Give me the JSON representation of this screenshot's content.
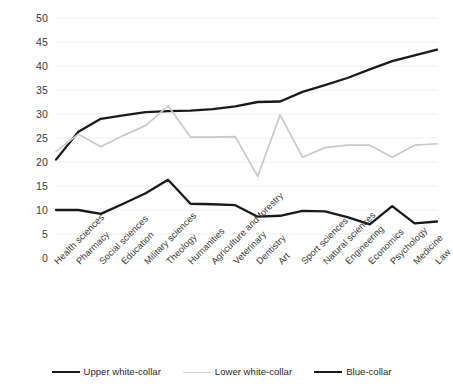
{
  "chart_data": {
    "type": "line",
    "title": "",
    "subtitle": "",
    "xlabel": "",
    "ylabel": "",
    "ylim": [
      0,
      50
    ],
    "yticks": [
      0,
      5,
      10,
      15,
      20,
      25,
      30,
      35,
      40,
      45,
      50
    ],
    "grid": true,
    "grid_axis": "y",
    "legend_position": "bottom",
    "categories": [
      "Health sciences",
      "Pharmacy",
      "Social sciences",
      "Education",
      "Military sciences",
      "Theology",
      "Humanities",
      "Agriculture and forestry",
      "Veterinary",
      "Dentistry",
      "Art",
      "Sport sciences",
      "Natural sciences",
      "Engineering",
      "Economics",
      "Psychology",
      "Medicine",
      "Law"
    ],
    "series": [
      {
        "name": "Upper white-collar",
        "color": "#1a1a1a",
        "width": 2.3,
        "values": [
          20.5,
          26.3,
          29.0,
          29.7,
          30.4,
          30.6,
          30.7,
          31.0,
          31.6,
          32.5,
          32.6,
          34.6,
          36.0,
          37.5,
          39.3,
          41.0,
          42.2,
          43.4
        ]
      },
      {
        "name": "Lower white-collar",
        "color": "#c9c9c9",
        "width": 1.7,
        "values": [
          22.2,
          25.8,
          23.2,
          25.5,
          27.6,
          31.7,
          25.2,
          25.2,
          25.3,
          17.0,
          29.8,
          21.0,
          23.0,
          23.5,
          23.5,
          21.0,
          23.5,
          23.8
        ]
      },
      {
        "name": "Blue-collar",
        "color": "#1a1a1a",
        "width": 2.3,
        "values": [
          10.0,
          10.0,
          9.2,
          11.3,
          13.5,
          16.3,
          11.3,
          11.2,
          11.0,
          8.6,
          8.8,
          9.8,
          9.7,
          8.5,
          7.0,
          10.8,
          7.2,
          7.6
        ]
      }
    ]
  },
  "yaxis": {
    "ticks": [
      "0",
      "5",
      "10",
      "15",
      "20",
      "25",
      "30",
      "35",
      "40",
      "45",
      "50"
    ]
  },
  "legend": {
    "items": [
      {
        "label": "Upper white-collar",
        "color": "#1a1a1a",
        "thickness": "2.6px"
      },
      {
        "label": "Lower white-collar",
        "color": "#cfcfcf",
        "thickness": "1.6px"
      },
      {
        "label": "Blue-collar",
        "color": "#1a1a1a",
        "thickness": "2.6px"
      }
    ]
  }
}
